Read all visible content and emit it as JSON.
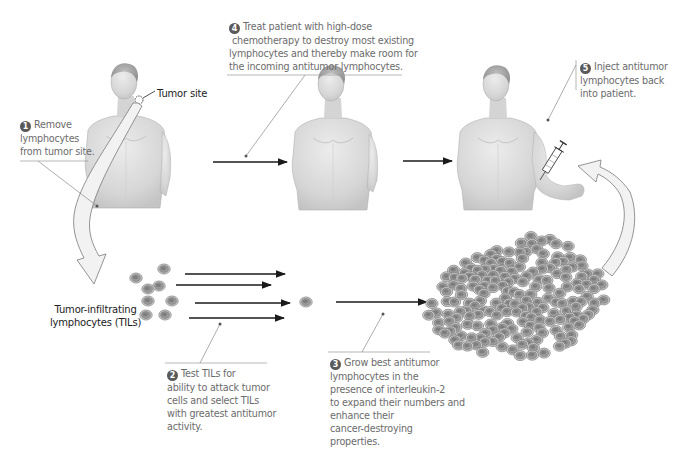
{
  "diagram": {
    "colors": {
      "caption_text": "#6b6b6b",
      "label_text": "#222222",
      "arrow": "#1a1a1a",
      "leader_line": "#8a8a8a",
      "cell_outer": "#b8b8b8",
      "cell_inner": "#7a7a7a",
      "curved_arrow_fill": "#eeeeee",
      "curved_arrow_stroke": "#7a7a7a",
      "skin": "#d9d9d9"
    },
    "steps": [
      {
        "number": "1",
        "lines": [
          "Remove",
          "lymphocytes",
          "from tumor site."
        ]
      },
      {
        "number": "2",
        "lines": [
          "Test TILs for",
          "ability to attack tumor",
          "cells and select TILs",
          "with greatest antitumor",
          "activity."
        ]
      },
      {
        "number": "3",
        "lines": [
          "Grow best antitumor",
          "lymphocytes in the",
          "presence of interleukin-2",
          "to expand their numbers and",
          "enhance their",
          "cancer-destroying",
          "properties."
        ]
      },
      {
        "number": "4",
        "lines": [
          "Treat patient with high-dose",
          "chemotherapy to destroy most existing",
          "lymphocytes and thereby make room for",
          "the incoming antitumor lymphocytes."
        ]
      },
      {
        "number": "5",
        "lines": [
          "Inject antitumor",
          "lymphocytes back",
          "into patient."
        ]
      }
    ],
    "labels": {
      "tumor_site": "Tumor site",
      "tils": [
        "Tumor-infiltrating",
        "lymphocytes (TILs)"
      ]
    },
    "figures": [
      {
        "name": "patient-with-tumor",
        "description": "male torso with tumor at neck"
      },
      {
        "name": "patient-after-chemo",
        "description": "male torso"
      },
      {
        "name": "patient-receiving-injection",
        "description": "male torso with syringe in arm"
      }
    ]
  }
}
